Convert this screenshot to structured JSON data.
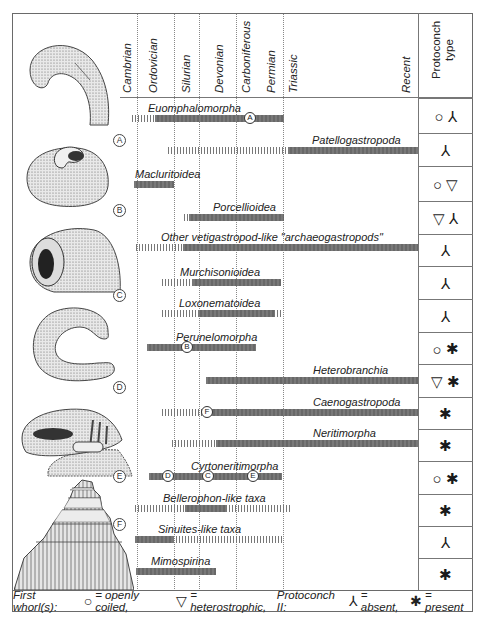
{
  "header": {
    "periods": [
      {
        "label": "Cambrian",
        "x": 121
      },
      {
        "label": "Ordovician",
        "x": 147
      },
      {
        "label": "Silurian",
        "x": 180
      },
      {
        "label": "Devonian",
        "x": 213
      },
      {
        "label": "Carboniferous",
        "x": 240
      },
      {
        "label": "Permian",
        "x": 265
      },
      {
        "label": "Triassic",
        "x": 287
      },
      {
        "label": "Recent",
        "x": 400
      }
    ],
    "protoconch_header_line1": "Protoconch",
    "protoconch_header_line2": "type"
  },
  "shells": [
    {
      "tag": "A",
      "x": 113,
      "y": 134
    },
    {
      "tag": "B",
      "x": 113,
      "y": 204
    },
    {
      "tag": "C",
      "x": 113,
      "y": 289
    },
    {
      "tag": "D",
      "x": 113,
      "y": 381
    },
    {
      "tag": "E",
      "x": 113,
      "y": 470
    },
    {
      "tag": "F",
      "x": 113,
      "y": 518
    }
  ],
  "taxa": [
    {
      "name": "Euomphalomorpha",
      "label_x": 148,
      "y": 118,
      "segments": [
        {
          "type": "hatch",
          "x0": 132,
          "x1": 155
        },
        {
          "type": "solid",
          "x0": 155,
          "x1": 284
        }
      ],
      "markers": [
        {
          "tag": "A",
          "x": 250
        }
      ],
      "protoconch": [
        "○",
        "⅄"
      ]
    },
    {
      "name": "Patellogastropoda",
      "label_x": 312,
      "y": 150,
      "segments": [
        {
          "type": "hatch",
          "x0": 168,
          "x1": 288
        },
        {
          "type": "solid",
          "x0": 288,
          "x1": 418
        }
      ],
      "markers": [],
      "protoconch": [
        "⅄"
      ]
    },
    {
      "name": "Macluritoidea",
      "label_x": 135,
      "y": 184,
      "segments": [
        {
          "type": "solid",
          "x0": 134,
          "x1": 174
        }
      ],
      "markers": [],
      "protoconch": [
        "○",
        "▽"
      ]
    },
    {
      "name": "Porcellioidea",
      "label_x": 213,
      "y": 217,
      "segments": [
        {
          "type": "hatch",
          "x0": 184,
          "x1": 189
        },
        {
          "type": "solid",
          "x0": 189,
          "x1": 284
        }
      ],
      "markers": [],
      "protoconch": [
        "▽",
        "⅄"
      ]
    },
    {
      "name": "Other vetigastropod-like \"archaeogastropods\"",
      "label_x": 161,
      "y": 247,
      "segments": [
        {
          "type": "hatch",
          "x0": 136,
          "x1": 183
        },
        {
          "type": "solid",
          "x0": 183,
          "x1": 418
        }
      ],
      "markers": [],
      "protoconch": [
        "⅄"
      ]
    },
    {
      "name": "Murchisonioidea",
      "label_x": 180,
      "y": 282,
      "segments": [
        {
          "type": "hatch",
          "x0": 162,
          "x1": 193
        },
        {
          "type": "solid",
          "x0": 193,
          "x1": 281
        }
      ],
      "markers": [],
      "protoconch": [
        "⅄"
      ]
    },
    {
      "name": "Loxonematoidea",
      "label_x": 179,
      "y": 313,
      "segments": [
        {
          "type": "hatch",
          "x0": 162,
          "x1": 198
        },
        {
          "type": "solid",
          "x0": 198,
          "x1": 274
        },
        {
          "type": "hatch",
          "x0": 274,
          "x1": 283
        }
      ],
      "markers": [],
      "protoconch": [
        "⅄"
      ]
    },
    {
      "name": "Perunelomorpha",
      "label_x": 176,
      "y": 347,
      "segments": [
        {
          "type": "solid",
          "x0": 147,
          "x1": 256
        }
      ],
      "markers": [
        {
          "tag": "B",
          "x": 187
        }
      ],
      "protoconch": [
        "○",
        "✱"
      ]
    },
    {
      "name": "Heterobranchia",
      "label_x": 313,
      "y": 380,
      "segments": [
        {
          "type": "solid",
          "x0": 206,
          "x1": 418
        }
      ],
      "markers": [],
      "protoconch": [
        "▽",
        "✱"
      ]
    },
    {
      "name": "Caenogastropoda",
      "label_x": 313,
      "y": 412,
      "segments": [
        {
          "type": "hatch",
          "x0": 162,
          "x1": 202
        },
        {
          "type": "solid",
          "x0": 211,
          "x1": 418
        }
      ],
      "markers": [
        {
          "tag": "F",
          "x": 207
        }
      ],
      "protoconch": [
        "✱"
      ]
    },
    {
      "name": "Neritimorpha",
      "label_x": 313,
      "y": 443,
      "segments": [
        {
          "type": "hatch",
          "x0": 172,
          "x1": 216
        },
        {
          "type": "solid",
          "x0": 216,
          "x1": 418
        }
      ],
      "markers": [],
      "protoconch": [
        "✱"
      ]
    },
    {
      "name": "Cyrtoneritimorpha",
      "label_x": 191,
      "y": 476,
      "segments": [
        {
          "type": "solid",
          "x0": 149,
          "x1": 282
        }
      ],
      "markers": [
        {
          "tag": "D",
          "x": 168
        },
        {
          "tag": "C",
          "x": 208
        },
        {
          "tag": "E",
          "x": 253
        }
      ],
      "protoconch": [
        "○",
        "✱"
      ]
    },
    {
      "name": "Bellerophon-like taxa",
      "label_x": 163,
      "y": 508,
      "segments": [
        {
          "type": "hatch",
          "x0": 135,
          "x1": 185
        },
        {
          "type": "solid",
          "x0": 185,
          "x1": 226
        },
        {
          "type": "hatch",
          "x0": 226,
          "x1": 290
        }
      ],
      "markers": [],
      "protoconch": [
        "✱"
      ]
    },
    {
      "name": "Sinuites-like taxa",
      "label_x": 158,
      "y": 539,
      "segments": [
        {
          "type": "solid",
          "x0": 135,
          "x1": 173
        },
        {
          "type": "hatch",
          "x0": 173,
          "x1": 282
        }
      ],
      "markers": [],
      "protoconch": [
        "⅄"
      ]
    },
    {
      "name": "Mimospirina",
      "label_x": 151,
      "y": 571,
      "segments": [
        {
          "type": "solid",
          "x0": 136,
          "x1": 216
        }
      ],
      "markers": [],
      "protoconch": [
        "✱"
      ]
    }
  ],
  "protoconch_rows": [
    98,
    133,
    166,
    201,
    234,
    266,
    299,
    332,
    364,
    397,
    429,
    461,
    494,
    526,
    558
  ],
  "footer": {
    "prefix": "First whorl(s):",
    "open_symbol": "○",
    "open_text": "= openly coiled,",
    "hetero_symbol": "▽",
    "hetero_text": "= heterostrophic,",
    "p2_label": "Protoconch II:",
    "absent_symbol": "⅄",
    "absent_text": "= absent,",
    "present_symbol": "✱",
    "present_text": "=  present"
  },
  "colors": {
    "bar": "#6e6e6e",
    "frame": "#6a6a6a",
    "text": "#222222"
  }
}
